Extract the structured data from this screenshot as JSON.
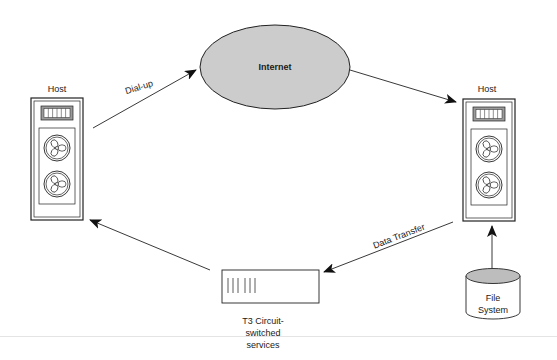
{
  "diagram": {
    "nodes": {
      "internet": {
        "label": "Internet",
        "shape": "ellipse",
        "fill": "#cccccc"
      },
      "host_left": {
        "label": "Host",
        "shape": "server-tower"
      },
      "host_right": {
        "label": "Host",
        "shape": "server-tower"
      },
      "t3": {
        "label_lines": [
          "T3 Circuit-",
          "switched",
          "services"
        ],
        "shape": "rack-unit"
      },
      "file_system": {
        "label_lines": [
          "File",
          "System"
        ],
        "shape": "cylinder",
        "top_fill": "#bdbdbd"
      }
    },
    "edges": [
      {
        "from": "host_left",
        "to": "internet",
        "label": "Dial-up"
      },
      {
        "from": "internet",
        "to": "host_right",
        "label": ""
      },
      {
        "from": "host_right",
        "to": "t3",
        "label": "Data Transfer"
      },
      {
        "from": "t3",
        "to": "host_left",
        "label": ""
      },
      {
        "from": "file_system",
        "to": "host_right",
        "label": ""
      }
    ]
  }
}
